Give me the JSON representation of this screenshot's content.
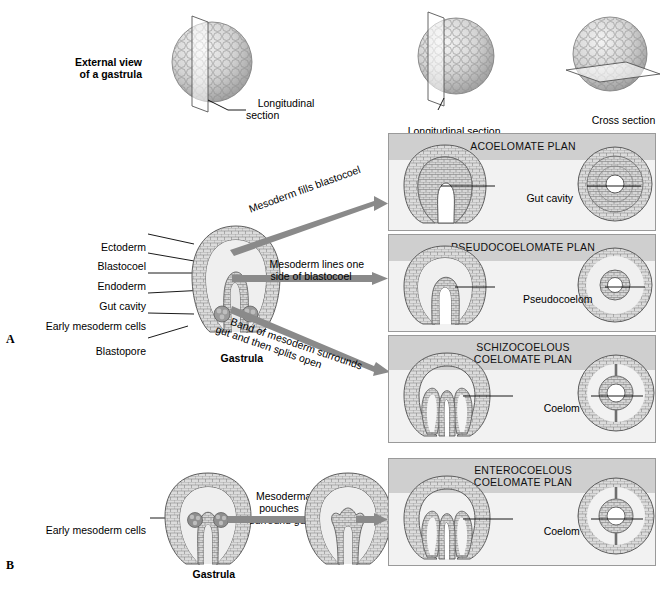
{
  "figure": {
    "type": "biology-diagram",
    "panels": [
      "A",
      "B"
    ]
  },
  "top": {
    "external_view_label": "External view\nof a gastrula",
    "longitudinal_section_label_left": "Longitudinal\nsection",
    "longitudinal_section_label_mid": "Longitudinal section",
    "cross_section_label": "Cross section"
  },
  "panelA": {
    "stamp": "A",
    "gastrula_caption": "Gastrula",
    "labels": [
      {
        "id": "ectoderm",
        "text": "Ectoderm"
      },
      {
        "id": "blastocoel",
        "text": "Blastocoel"
      },
      {
        "id": "endoderm",
        "text": "Endoderm"
      },
      {
        "id": "gut-cavity",
        "text": "Gut cavity"
      },
      {
        "id": "early-mesoderm-cells",
        "text": "Early mesoderm cells"
      },
      {
        "id": "blastopore",
        "text": "Blastopore"
      }
    ],
    "arrows": [
      {
        "id": "arrow-acoelomate",
        "text": "Mesoderm fills blastocoel",
        "rotation": -21
      },
      {
        "id": "arrow-pseudocoelomate",
        "text": "Mesoderm lines one\nside of blastocoel",
        "rotation": 0
      },
      {
        "id": "arrow-schizocoelous",
        "text": "Band of mesoderm surrounds\ngut and then splits open",
        "rotation": 19
      }
    ],
    "plans": [
      {
        "id": "acoelomate",
        "title": "ACOELOMATE PLAN",
        "callout": "Gut cavity"
      },
      {
        "id": "pseudocoelomate",
        "title": "PSEUDOCOELOMATE PLAN",
        "callout": "Pseudocoelom"
      },
      {
        "id": "schizocoelous",
        "title": "SCHIZOCOELOUS\nCOELOMATE PLAN",
        "callout": "Coelom"
      }
    ]
  },
  "panelB": {
    "stamp": "B",
    "gastrula_caption": "Gastrula",
    "label_early_mesoderm": "Early mesoderm cells",
    "arrow_text": "Mesodermal\npouches\nsurround gut",
    "plan": {
      "id": "enterocoelous",
      "title": "ENTEROCOELOUS\nCOELOMATE PLAN",
      "callout": "Coelom"
    }
  },
  "colors": {
    "arrow_gray": "#8a8a8a",
    "panel_band": "#cfcfcf",
    "panel_body": "#f2f2f2",
    "panel_border": "#9a9a9a",
    "cell_fill": "#d8d8d8",
    "cell_stroke": "#6f6f6f",
    "mesoderm_dark": "#8f8f8f",
    "cavity_white": "#ffffff",
    "text": "#000000"
  }
}
